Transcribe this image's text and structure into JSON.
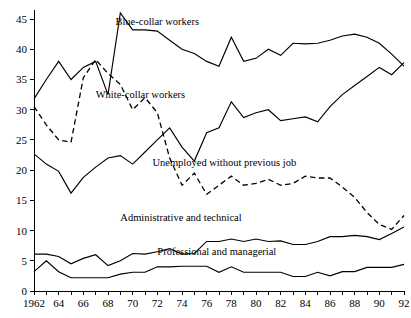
{
  "chart_data": {
    "type": "line",
    "title": "",
    "subtitle": "",
    "xlabel": "",
    "ylabel": "",
    "xlim": [
      1962,
      1992
    ],
    "ylim": [
      0,
      46.5
    ],
    "yticks": [
      0,
      5,
      10,
      15,
      20,
      25,
      30,
      35,
      40,
      45
    ],
    "ytick_labels": [
      "0",
      "5",
      "10",
      "15",
      "20",
      "25",
      "30",
      "35",
      "40",
      "45"
    ],
    "xticks": [
      1962,
      1963,
      1964,
      1965,
      1966,
      1967,
      1968,
      1969,
      1970,
      1971,
      1972,
      1973,
      1974,
      1975,
      1976,
      1977,
      1978,
      1979,
      1980,
      1981,
      1982,
      1983,
      1984,
      1985,
      1986,
      1987,
      1988,
      1989,
      1990,
      1991,
      1992
    ],
    "xtick_labels": [
      "1962",
      "",
      "64",
      "",
      "66",
      "",
      "68",
      "",
      "70",
      "",
      "72",
      "",
      "74",
      "",
      "76",
      "",
      "78",
      "",
      "80",
      "",
      "82",
      "",
      "84",
      "",
      "86",
      "",
      "88",
      "",
      "90",
      "",
      "92"
    ],
    "grid": false,
    "legend": "inline-annotations",
    "x": [
      1962,
      1963,
      1964,
      1965,
      1966,
      1967,
      1968,
      1969,
      1970,
      1971,
      1972,
      1973,
      1974,
      1975,
      1976,
      1977,
      1978,
      1979,
      1980,
      1981,
      1982,
      1983,
      1984,
      1985,
      1986,
      1987,
      1988,
      1989,
      1990,
      1991,
      1992
    ],
    "series": [
      {
        "name": "Blue-collar workers",
        "style": "solid",
        "label_x": 1968.6,
        "label_y": 44.1,
        "values": [
          31.8,
          35.0,
          38.0,
          35.0,
          37.0,
          38.0,
          32.5,
          46.0,
          43.2,
          43.2,
          43.0,
          41.5,
          40.0,
          39.3,
          38.0,
          37.2,
          42.0,
          38.0,
          38.5,
          40.0,
          39.0,
          41.0,
          40.9,
          41.0,
          41.5,
          42.2,
          42.5,
          42.0,
          41.0,
          39.2,
          37.2
        ]
      },
      {
        "name": "White-collar workers",
        "style": "solid",
        "label_x": 1967.0,
        "label_y": 32.0,
        "values": [
          22.7,
          21.0,
          19.8,
          16.2,
          18.8,
          20.5,
          22.0,
          22.4,
          21.0,
          23.0,
          25.0,
          27.0,
          23.8,
          21.5,
          26.2,
          27.0,
          31.3,
          28.7,
          29.5,
          30.0,
          28.2,
          28.5,
          28.8,
          28.0,
          30.5,
          32.5,
          34.0,
          35.5,
          37.0,
          35.8,
          37.8
        ]
      },
      {
        "name": "Unemployed without previous job",
        "style": "dashed",
        "label_x": 1971.6,
        "label_y": 20.7,
        "values": [
          30.5,
          27.5,
          25.0,
          24.6,
          35.3,
          38.3,
          36.0,
          34.2,
          30.0,
          32.0,
          29.5,
          22.0,
          17.5,
          19.5,
          16.0,
          17.5,
          19.0,
          17.5,
          17.8,
          18.5,
          17.5,
          17.8,
          19.0,
          18.7,
          18.7,
          17.2,
          15.5,
          13.0,
          11.0,
          10.2,
          12.5
        ]
      },
      {
        "name": "Administrative and technical",
        "style": "solid",
        "label_x": 1969.0,
        "label_y": 11.6,
        "values": [
          6.1,
          6.1,
          5.7,
          4.5,
          5.4,
          6.0,
          4.2,
          5.0,
          6.2,
          6.1,
          6.5,
          7.0,
          6.1,
          6.2,
          8.2,
          8.2,
          8.6,
          8.2,
          8.6,
          8.2,
          8.3,
          7.7,
          7.7,
          8.2,
          9.0,
          9.0,
          9.2,
          9.0,
          8.5,
          9.5,
          10.6
        ]
      },
      {
        "name": "Professional and managerial",
        "style": "solid",
        "label_x": 1972.0,
        "label_y": 5.9,
        "values": [
          3.2,
          5.0,
          3.2,
          2.2,
          2.2,
          2.2,
          2.2,
          2.8,
          3.1,
          3.1,
          4.0,
          4.0,
          4.1,
          4.1,
          4.1,
          3.1,
          4.0,
          3.1,
          3.1,
          3.1,
          3.1,
          2.4,
          2.4,
          3.1,
          2.5,
          3.2,
          3.2,
          3.9,
          3.9,
          3.9,
          4.4
        ]
      }
    ]
  }
}
